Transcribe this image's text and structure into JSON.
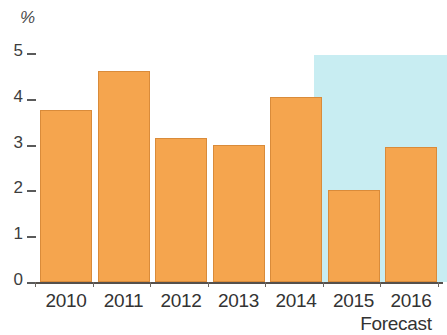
{
  "chart_data": {
    "type": "bar",
    "title": "",
    "subtitle": "",
    "xlabel": "",
    "ylabel": "%",
    "unit_label": "%",
    "categories": [
      "2010",
      "2011",
      "2012",
      "2013",
      "2014",
      "2015",
      "2016"
    ],
    "values": [
      3.75,
      4.6,
      3.15,
      3.0,
      4.05,
      2.0,
      2.95
    ],
    "ylim": [
      0,
      5
    ],
    "ytick_labels": [
      "0",
      "1",
      "2",
      "3",
      "4",
      "5"
    ],
    "ytick_values": [
      0,
      1,
      2,
      3,
      4,
      5
    ],
    "grid": false,
    "legend": null,
    "annotations": [
      {
        "text": "Forecast",
        "applies_to": [
          "2015",
          "2016"
        ],
        "position": "below-axis-right"
      }
    ],
    "forecast_band": {
      "label": "Forecast",
      "start_category": "2015",
      "end_category": "2016",
      "color": "#c8edf2"
    },
    "colors": {
      "bar": "#f5a54e",
      "bar_border": "#d98b3a",
      "forecast_shading": "#c8edf2",
      "axis": "#55504c",
      "text": "#333333"
    }
  },
  "axis": {
    "unit": "%",
    "ticks": [
      "5",
      "4",
      "3",
      "2",
      "1",
      "0"
    ]
  },
  "labels": {
    "forecast": "Forecast"
  }
}
